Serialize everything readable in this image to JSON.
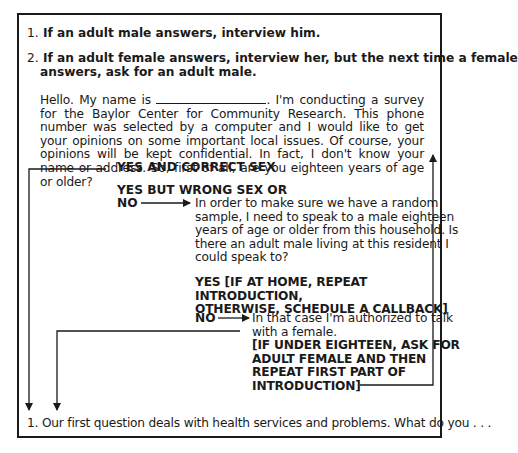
{
  "instructions": [
    {
      "number": "1.",
      "text": "If an adult male answers, interview him."
    },
    {
      "number": "2.",
      "text_line1": "If an adult female answers, interview her, but the next time a female",
      "text_line2": "answers, ask for an adult male."
    }
  ],
  "introduction": {
    "before_blank": "Hello. My name is ",
    "after_blank": ". I'm conducting a survey for the Baylor Center for Community Research. This phone number was selected by a computer and I would like to get your opinions on some important local issues. Of course,  your opinions will be kept confidential. In fact, I don't know your name or address. So, first of all, are you eighteen years of age or older?"
  },
  "branches": {
    "yes_correct": "YES AND CORRECT SEX",
    "yes_wrong_line1": "YES BUT WRONG SEX OR",
    "yes_wrong_line2": "NO",
    "male_request": [
      "In order to make sure we have a random",
      "sample, I need to speak to a male eighteen",
      "years of age or older from this household. Is",
      "there an adult male living at this resident I",
      "could speak to?"
    ],
    "yes_callback": [
      "YES [IF AT HOME, REPEAT INTRODUCTION,",
      "OTHERWISE, SCHEDULE A CALLBACK]"
    ],
    "no_label": "NO",
    "female_auth": [
      "In that case I'm authorized to talk",
      "with a female."
    ],
    "under_eighteen": [
      "[IF UNDER EIGHTEEN, ASK FOR",
      "ADULT FEMALE AND THEN",
      "REPEAT FIRST PART OF",
      "INTRODUCTION]"
    ]
  },
  "first_question": "1. Our first question deals with health services and problems. What do you . . ."
}
